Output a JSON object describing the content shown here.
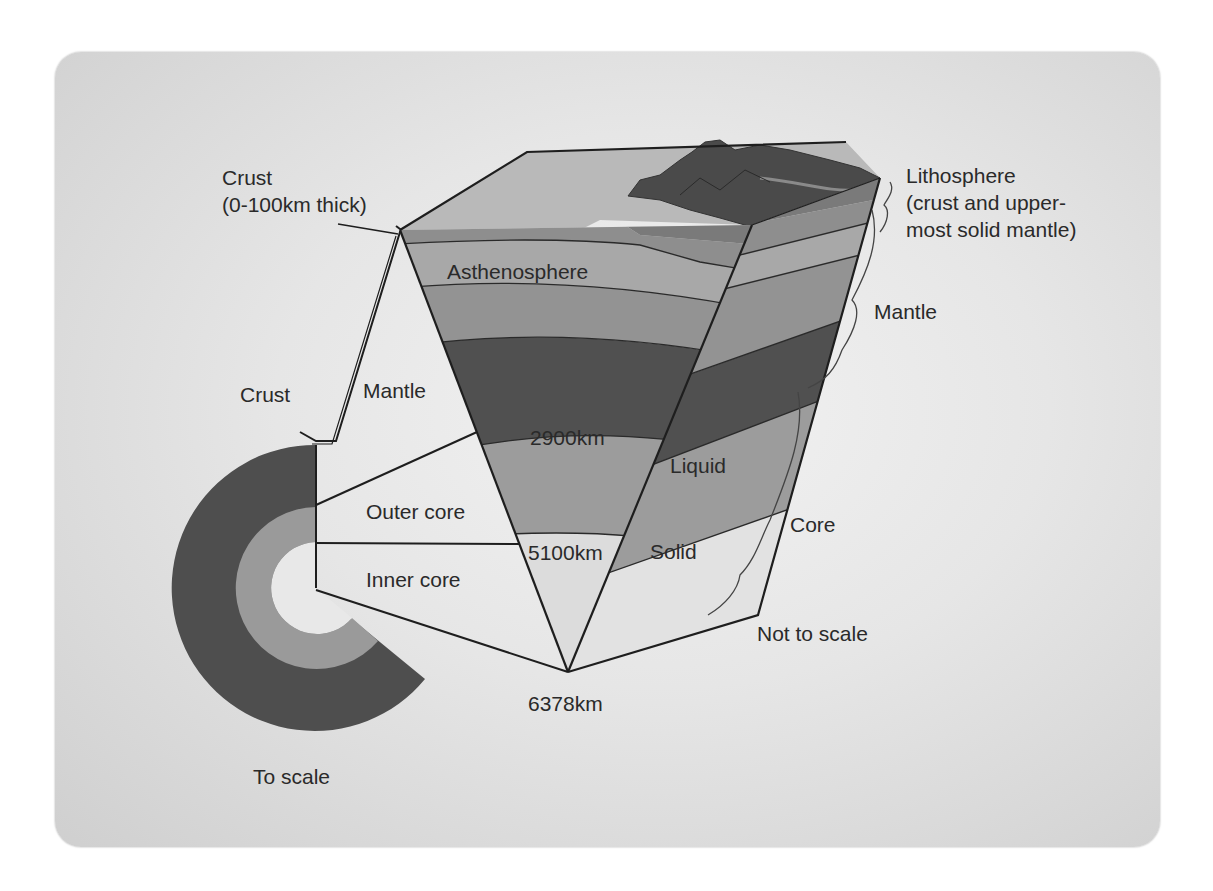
{
  "labels": {
    "crust_top_line1": "Crust",
    "crust_top_line2": "(0-100km thick)",
    "lithosphere_line1": "Lithosphere",
    "lithosphere_line2": "(crust and upper-",
    "lithosphere_line3": "most solid mantle)",
    "asthenosphere": "Asthenosphere",
    "mantle_right": "Mantle",
    "mantle_left": "Mantle",
    "crust_left": "Crust",
    "depth_2900": "2900km",
    "liquid": "Liquid",
    "outer_core": "Outer core",
    "inner_core": "Inner core",
    "depth_5100": "5100km",
    "solid": "Solid",
    "core": "Core",
    "not_to_scale": "Not to scale",
    "depth_6378": "6378km",
    "to_scale": "To scale"
  },
  "colors": {
    "background": "#e6e6e6",
    "outline": "#1e1e1e",
    "surface_top": "#b9b9b9",
    "mountains": "#4a4a4a",
    "crust_band": "#7a7a7a",
    "litho_band": "#8e8e8e",
    "asthenosphere": "#a8a8a8",
    "upper_mantle": "#939393",
    "lower_mantle": "#505050",
    "outer_core": "#9c9c9c",
    "inner_core": "#dcdcdc",
    "scale_mantle": "#4e4e4e",
    "scale_outer_core": "#9a9a9a",
    "scale_inner_core": "#e8e8e8"
  },
  "layers": [
    {
      "name": "Crust",
      "depth_range": "0-100km"
    },
    {
      "name": "Asthenosphere"
    },
    {
      "name": "Mantle",
      "bottom_depth": "2900km"
    },
    {
      "name": "Outer core",
      "state": "Liquid",
      "bottom_depth": "5100km"
    },
    {
      "name": "Inner core",
      "state": "Solid",
      "bottom_depth": "6378km"
    }
  ]
}
